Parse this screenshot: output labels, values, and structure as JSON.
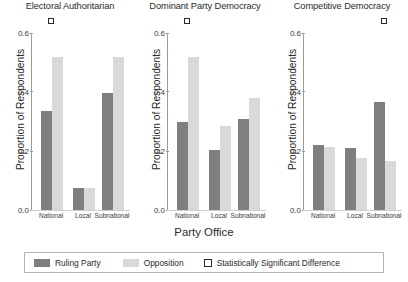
{
  "chart_data": {
    "type": "bar",
    "title": "",
    "xlabel": "Party Office",
    "ylabel": "Proportion of Respondents",
    "ylim": [
      0.0,
      0.6
    ],
    "yticks": [
      "0.0",
      "0.2",
      "0.4",
      "0.6"
    ],
    "ytick_values": [
      0.0,
      0.2,
      0.4,
      0.6
    ],
    "grid": false,
    "legend_position": "bottom",
    "categories": [
      "National",
      "Local",
      "Subnational"
    ],
    "series": [
      {
        "name": "Ruling Party",
        "color": "#7f7f7f"
      },
      {
        "name": "Opposition",
        "color": "#d9d9d9"
      }
    ],
    "panels": [
      {
        "title": "Electoral Authoritarian",
        "categories": [
          "National",
          "Local",
          "Subnational"
        ],
        "series": [
          {
            "name": "Ruling Party",
            "values": [
              0.335,
              0.075,
              0.395
            ]
          },
          {
            "name": "Opposition",
            "values": [
              0.52,
              0.075,
              0.52
            ]
          }
        ],
        "significant": [
          true,
          false,
          false
        ]
      },
      {
        "title": "Dominant Party Democracy",
        "categories": [
          "National",
          "Local",
          "Subnational"
        ],
        "series": [
          {
            "name": "Ruling Party",
            "values": [
              0.3,
              0.205,
              0.31
            ]
          },
          {
            "name": "Opposition",
            "values": [
              0.52,
              0.285,
              0.38
            ]
          }
        ],
        "significant": [
          true,
          false,
          false
        ]
      },
      {
        "title": "Competitive Democracy",
        "categories": [
          "National",
          "Local",
          "Subnational"
        ],
        "series": [
          {
            "name": "Ruling Party",
            "values": [
              0.22,
              0.21,
              0.365
            ]
          },
          {
            "name": "Opposition",
            "values": [
              0.215,
              0.175,
              0.165
            ]
          }
        ],
        "significant": [
          false,
          false,
          true
        ]
      }
    ],
    "annotations": [
      {
        "name": "significance-marker",
        "symbol": "open-square",
        "meaning": "Statistically Significant Difference"
      }
    ]
  },
  "legend": {
    "items": [
      {
        "label": "Ruling Party",
        "swatch": "ruling-party-swatch",
        "color": "#7f7f7f"
      },
      {
        "label": "Opposition",
        "swatch": "opposition-swatch",
        "color": "#d9d9d9"
      },
      {
        "label": "Statistically Significant Difference",
        "swatch": "significance-square-icon",
        "color": "#ffffff"
      }
    ]
  }
}
